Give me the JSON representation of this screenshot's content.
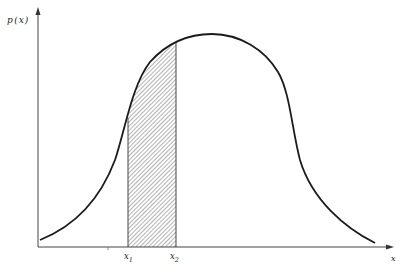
{
  "diagram": {
    "y_axis_label": "p",
    "y_axis_paren_open": "(",
    "y_axis_var": "x",
    "y_axis_paren_close": ")",
    "x_axis_label": "x",
    "bound_lower": {
      "base": "x",
      "sub": "1"
    },
    "bound_upper": {
      "base": "x",
      "sub": "2"
    },
    "colors": {
      "line": "#1a1a1a",
      "axis": "#444444",
      "hatch": "#555555",
      "background": "#ffffff"
    }
  }
}
